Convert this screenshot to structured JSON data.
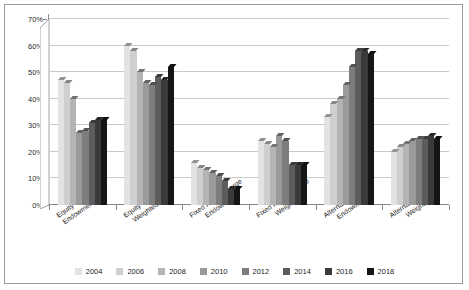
{
  "chart_data": {
    "type": "bar",
    "title": "",
    "subtitle": "",
    "xlabel": "",
    "ylabel": "",
    "ylim": [
      0,
      70
    ],
    "ytick_labels": [
      "0%",
      "10%",
      "20%",
      "30%",
      "40%",
      "50%",
      "60%",
      "70%"
    ],
    "ytick_values": [
      0,
      10,
      20,
      30,
      40,
      50,
      60,
      70
    ],
    "grid": true,
    "legend_position": "bottom",
    "categories": [
      "Equity-Large\nEndowment",
      "Equity-Equal\nWeighted",
      "Fixed Income-Large\nEndowment",
      "Fixed Income-Equal\nWeighted",
      "Alternatives-Large\nEndowment",
      "Alternatives-Equal\nWeighted"
    ],
    "category_labels": [
      [
        "Equity-Large",
        "Endowment"
      ],
      [
        "Equity-Equal",
        "Weighted"
      ],
      [
        "Fixed Income-Large",
        "Endowment"
      ],
      [
        "Fixed Income-Equal",
        "Weighted"
      ],
      [
        "Alternatives-Large",
        "Endowment"
      ],
      [
        "Alternatives-Equal",
        "Weighted"
      ]
    ],
    "series": [
      {
        "name": "2004",
        "color": "#e2e2e2",
        "values": [
          47,
          60,
          16,
          24,
          33,
          20
        ]
      },
      {
        "name": "2006",
        "color": "#cfcfcf",
        "values": [
          46,
          58,
          14,
          23,
          38,
          22
        ]
      },
      {
        "name": "2008",
        "color": "#b4b4b4",
        "values": [
          40,
          50,
          13,
          22,
          40,
          23
        ]
      },
      {
        "name": "2010",
        "color": "#9a9a9a",
        "values": [
          27,
          46,
          12,
          26,
          45,
          24
        ]
      },
      {
        "name": "2012",
        "color": "#7d7d7d",
        "values": [
          28,
          45,
          11,
          24,
          52,
          25
        ]
      },
      {
        "name": "2014",
        "color": "#5c5c5c",
        "values": [
          31,
          48,
          9,
          15,
          58,
          25
        ]
      },
      {
        "name": "2016",
        "color": "#3a3a3a",
        "values": [
          32,
          47,
          6,
          15,
          58,
          26
        ]
      },
      {
        "name": "2018",
        "color": "#151515",
        "values": [
          32,
          52,
          6,
          15,
          57,
          25
        ]
      }
    ]
  },
  "legend": {
    "items": [
      {
        "label": "2004"
      },
      {
        "label": "2006"
      },
      {
        "label": "2008"
      },
      {
        "label": "2010"
      },
      {
        "label": "2012"
      },
      {
        "label": "2014"
      },
      {
        "label": "2016"
      },
      {
        "label": "2018"
      }
    ]
  },
  "style": {
    "grid_color": "#c9c9c9",
    "axis_color": "#8a8a8a",
    "border_color": "#9a9a9a",
    "text_color": "#1c1c1c",
    "background": "#ffffff"
  }
}
